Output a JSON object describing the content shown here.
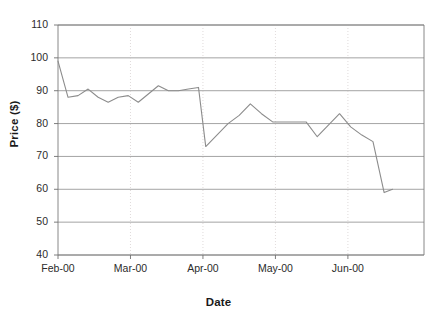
{
  "chart_data": {
    "type": "line",
    "title": "",
    "xlabel": "Date",
    "ylabel": "Price ($)",
    "ylim": [
      40,
      110
    ],
    "ytick_values": [
      110,
      100,
      90,
      80,
      70,
      60,
      50,
      40
    ],
    "ytick_labels": [
      "110",
      "100",
      "90",
      "80",
      "70",
      "60",
      "50",
      "40"
    ],
    "xtick_labels": [
      "Feb-00",
      "Mar-00",
      "Apr-00",
      "May-00",
      "Jun-00"
    ],
    "xtick_positions": [
      0,
      13,
      26,
      39,
      52
    ],
    "grid": true,
    "legend": false,
    "line_color": "#8c8c8c",
    "series": [
      {
        "name": "Price",
        "x": [
          0,
          1.8,
          3.6,
          5.4,
          7.2,
          9.0,
          10.8,
          12.6,
          14.4,
          16.2,
          18.0,
          19.8,
          21.6,
          23.4,
          25.2,
          26.5,
          28.5,
          30.5,
          32.5,
          34.5,
          36.5,
          38.5,
          40.5,
          42.5,
          44.5,
          46.5,
          48.5,
          50.5,
          52.5,
          54.5,
          56.5,
          58.5,
          60.0
        ],
        "values": [
          99.0,
          88.0,
          88.5,
          90.5,
          88.0,
          86.5,
          88.0,
          88.5,
          86.5,
          89.0,
          91.5,
          90.0,
          90.0,
          90.5,
          91.0,
          73.0,
          76.5,
          80.0,
          82.5,
          86.0,
          83.0,
          80.5,
          80.5,
          80.5,
          80.5,
          76.0,
          79.5,
          83.0,
          79.0,
          76.5,
          74.5,
          59.0,
          60.0
        ]
      }
    ]
  },
  "axes": {
    "plot_left": 58,
    "plot_right": 424,
    "plot_top": 25,
    "plot_bottom": 255
  }
}
